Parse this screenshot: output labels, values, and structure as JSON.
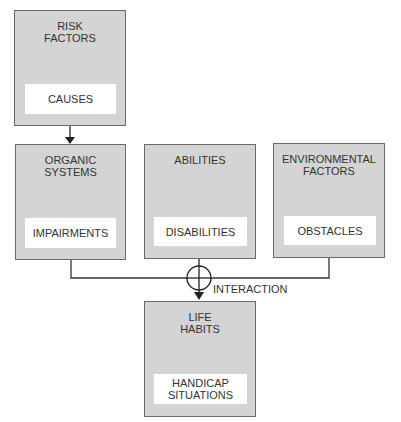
{
  "diagram": {
    "nodes": [
      {
        "id": "risk",
        "title": "RISK\nFACTORS",
        "inner": "CAUSES"
      },
      {
        "id": "organic",
        "title": "ORGANIC\nSYSTEMS",
        "inner": "IMPAIRMENTS"
      },
      {
        "id": "abilities",
        "title": "ABILITIES",
        "inner": "DISABILITIES"
      },
      {
        "id": "environmental",
        "title": "ENVIRONMENTAL\nFACTORS",
        "inner": "OBSTACLES"
      },
      {
        "id": "life",
        "title": "LIFE\nHABITS",
        "inner": "HANDICAP\nSITUATIONS"
      }
    ],
    "edges": [
      {
        "from": "risk",
        "to": "organic",
        "type": "arrow"
      },
      {
        "from": "organic",
        "to": "interaction",
        "type": "line"
      },
      {
        "from": "abilities",
        "to": "interaction",
        "type": "line"
      },
      {
        "from": "environmental",
        "to": "interaction",
        "type": "line"
      },
      {
        "from": "interaction",
        "to": "life",
        "type": "arrow"
      }
    ],
    "interaction_label": "INTERACTION",
    "colors": {
      "box_fill": "#d4d4d4",
      "inner_fill": "#ffffff",
      "stroke": "#333333"
    }
  }
}
